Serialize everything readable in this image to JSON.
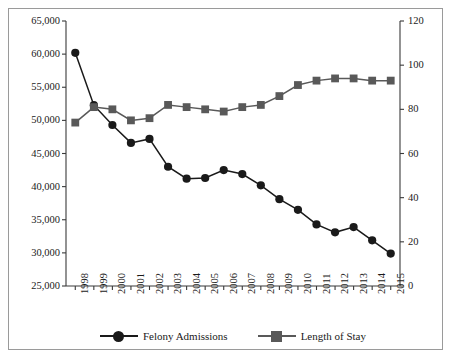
{
  "figure": {
    "background": "#ffffff",
    "border_color": "#9a9a9a"
  },
  "chart_data": {
    "type": "line",
    "title": "",
    "xlabel": "",
    "ylabel": "",
    "grid": false,
    "legend_position": "bottom",
    "categories": [
      "1998",
      "1999",
      "2000",
      "2001",
      "2002",
      "2003",
      "2004",
      "2005",
      "2006",
      "2007",
      "2008",
      "2009",
      "2010",
      "2011",
      "2012",
      "2013",
      "2014",
      "2015"
    ],
    "series": [
      {
        "name": "Felony Admissions",
        "axis": "left",
        "marker": "circle",
        "color": "#1a1a1a",
        "values": [
          60200,
          52300,
          49300,
          46600,
          47200,
          43000,
          41200,
          41300,
          42500,
          41900,
          40200,
          38100,
          36500,
          34300,
          33100,
          33900,
          31900,
          29900
        ]
      },
      {
        "name": "Length of Stay",
        "axis": "right",
        "marker": "square",
        "color": "#595959",
        "values": [
          74,
          81,
          80,
          75,
          76,
          82,
          81,
          80,
          79,
          81,
          82,
          86,
          91,
          93,
          94,
          94,
          93,
          93
        ]
      }
    ],
    "axes": {
      "left": {
        "label": "",
        "min": 25000,
        "max": 65000,
        "step": 5000,
        "tick_labels": [
          "65,000",
          "60,000",
          "55,000",
          "50,000",
          "45,000",
          "40,000",
          "35,000",
          "30,000",
          "25,000"
        ]
      },
      "right": {
        "label": "",
        "min": 0,
        "max": 120,
        "step": 20,
        "tick_labels": [
          "120",
          "100",
          "80",
          "60",
          "40",
          "20",
          "0"
        ]
      },
      "x": {
        "tick_labels": [
          "1998",
          "1999",
          "2000",
          "2001",
          "2002",
          "2003",
          "2004",
          "2005",
          "2006",
          "2007",
          "2008",
          "2009",
          "2010",
          "2011",
          "2012",
          "2013",
          "2014",
          "2015"
        ]
      }
    },
    "legend": [
      {
        "label": "Felony Admissions",
        "marker": "circle",
        "color": "#1a1a1a"
      },
      {
        "label": "Length of Stay",
        "marker": "square",
        "color": "#595959"
      }
    ]
  }
}
